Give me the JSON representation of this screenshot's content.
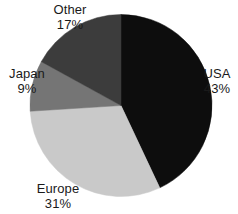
{
  "chart_data": {
    "type": "pie",
    "title": "",
    "subtitle": "",
    "xlabel": "",
    "ylabel": "",
    "legend_position": "none",
    "labels_position": "outside",
    "grid": false,
    "start_angle_deg": 0,
    "direction": "clockwise",
    "categories": [
      "USA",
      "Europe",
      "Japan",
      "Other"
    ],
    "values": [
      43,
      31,
      9,
      17
    ],
    "units": "%",
    "slices": [
      {
        "label": "USA",
        "value": 43,
        "value_text": "43%",
        "color": "#0d0d0d",
        "angle_deg": 154.8
      },
      {
        "label": "Europe",
        "value": 31,
        "value_text": "31%",
        "color": "#c9c9c9",
        "angle_deg": 111.6
      },
      {
        "label": "Japan",
        "value": 9,
        "value_text": "9%",
        "color": "#757575",
        "angle_deg": 32.4
      },
      {
        "label": "Other",
        "value": 17,
        "value_text": "17%",
        "color": "#3c3c3c",
        "angle_deg": 61.2
      }
    ]
  },
  "labels": {
    "usa": {
      "name": "USA",
      "value": "43%"
    },
    "europe": {
      "name": "Europe",
      "value": "31%"
    },
    "japan": {
      "name": "Japan",
      "value": "9%"
    },
    "other": {
      "name": "Other",
      "value": "17%"
    }
  },
  "colors": {
    "background": "#ffffff",
    "text": "#1a1a1a",
    "usa": "#0d0d0d",
    "europe": "#c9c9c9",
    "japan": "#757575",
    "other": "#3c3c3c"
  }
}
